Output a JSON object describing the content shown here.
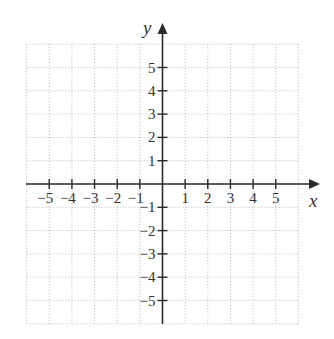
{
  "chart_data": {
    "type": "coordinate-plane",
    "title": "",
    "xlabel": "x",
    "ylabel": "y",
    "xlim": [
      -6,
      6
    ],
    "ylim": [
      -6,
      6
    ],
    "grid": true,
    "grid_style": "dotted",
    "x_ticks": [
      -5,
      -4,
      -3,
      -2,
      -1,
      1,
      2,
      3,
      4,
      5
    ],
    "y_ticks": [
      -5,
      -4,
      -3,
      -2,
      -1,
      1,
      2,
      3,
      4,
      5
    ],
    "x_tick_labels": [
      "−5",
      "−4",
      "−3",
      "−2",
      "−1",
      "1",
      "2",
      "3",
      "4",
      "5"
    ],
    "y_tick_labels": [
      "−5",
      "−4",
      "−3",
      "−2",
      "−1",
      "1",
      "2",
      "3",
      "4",
      "5"
    ],
    "series": []
  },
  "colors": {
    "axis": "#2a2a2a",
    "grid": "#b8b8b8",
    "text": "#333333"
  }
}
